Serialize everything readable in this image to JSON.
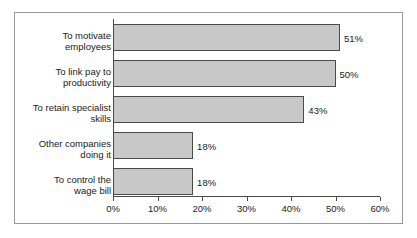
{
  "chart_data": {
    "type": "bar",
    "orientation": "horizontal",
    "title": "",
    "xlabel": "",
    "ylabel": "",
    "categories": [
      "To motivate\nemployees",
      "To link pay to\nproductivity",
      "To retain specialist\nskills",
      "Other companies\ndoing it",
      "To control the\nwage bill"
    ],
    "values": [
      51,
      50,
      43,
      18,
      18
    ],
    "value_labels": [
      "51%",
      "50%",
      "43%",
      "18%",
      "18%"
    ],
    "xlim": [
      0,
      60
    ],
    "xticks": [
      0,
      10,
      20,
      30,
      40,
      50,
      60
    ],
    "xtick_labels": [
      "0%",
      "10%",
      "20%",
      "30%",
      "40%",
      "50%",
      "60%"
    ],
    "grid": false,
    "legend": false,
    "colors": {
      "bar_fill": "#c8c8c8",
      "bar_border": "#4a4a4a",
      "axis": "#4a4a4a",
      "text": "#1a1a1a",
      "frame_border": "#9a9a9a",
      "background": "#ffffff"
    }
  }
}
